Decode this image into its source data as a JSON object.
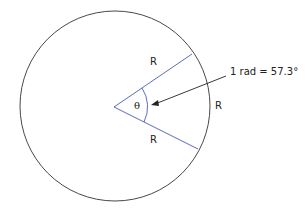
{
  "diagram": {
    "labels": {
      "radius_upper": "R",
      "radius_lower": "R",
      "arc": "R",
      "angle": "θ",
      "annotation": "1 rad = 57.3°"
    },
    "colors": {
      "circle": "#333333",
      "radii": "#4a5bb5",
      "arrow": "#222222"
    }
  }
}
